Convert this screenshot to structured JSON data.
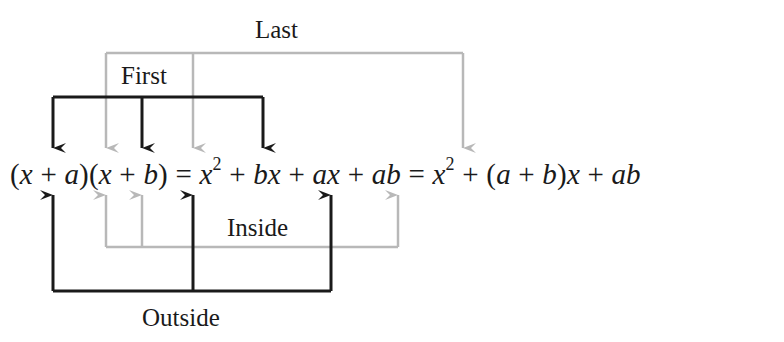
{
  "labels": {
    "last": "Last",
    "first": "First",
    "inside": "Inside",
    "outside": "Outside"
  },
  "equation": {
    "lhs": [
      "(x + a)(x + b)"
    ],
    "p1": "(",
    "x1": "x",
    "plus": " + ",
    "a1": "a",
    "p2": ")(",
    "x2": "x",
    "b1": "b",
    "p3": ")",
    "eq1": " = ",
    "x3": "x",
    "sq": "2",
    "bx": "bx",
    "ax": "ax",
    "ab": "ab",
    "p4": "(",
    "a2": "a",
    "b2": "b",
    "p5": ")",
    "x4": "x",
    "ab2": "ab"
  },
  "colors": {
    "black_arrow": "#1a1a1a",
    "gray_arrow": "#b8b8b8"
  }
}
